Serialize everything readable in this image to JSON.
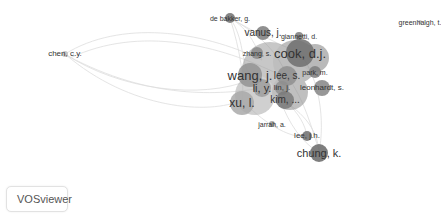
{
  "app": {
    "name": "VOSviewer"
  },
  "network": {
    "type": "co-authorship",
    "colors": {
      "link": "#cfcfcf",
      "node_dark": "#6e6e6e",
      "node_mid": "#8f8f8f",
      "node_light": "#b5b5b5",
      "label": "#333333"
    },
    "nodes": [
      {
        "label": "de bakker, g.",
        "x": 230,
        "y": 18,
        "r": 5,
        "size": 7,
        "shade": "#707070"
      },
      {
        "label": "vanus, j.",
        "x": 263,
        "y": 33,
        "r": 7,
        "size": 10,
        "shade": "#7c7c7c"
      },
      {
        "label": "giannetti, d.",
        "x": 299,
        "y": 36,
        "r": 4,
        "size": 7,
        "shade": "#7a7a7a"
      },
      {
        "label": "greenhalgh, t.",
        "x": 420,
        "y": 22,
        "r": 2,
        "size": 7,
        "shade": "#bbbbbb"
      },
      {
        "label": "chen, c.y.",
        "x": 65,
        "y": 54,
        "r": 3,
        "size": 8,
        "shade": "#bdbdbd"
      },
      {
        "label": "zhang, s.",
        "x": 257,
        "y": 53,
        "r": 6,
        "size": 7,
        "shade": "#8a8a8a"
      },
      {
        "label": "cook, d.j.",
        "x": 300,
        "y": 53,
        "r": 14,
        "size": 13,
        "shade": "#6f6f6f"
      },
      {
        "label": "wang, j.",
        "x": 250,
        "y": 75,
        "r": 12,
        "size": 13,
        "shade": "#939393"
      },
      {
        "label": "lee, s.",
        "x": 287,
        "y": 76,
        "r": 10,
        "size": 10,
        "shade": "#8f8f8f"
      },
      {
        "label": "park, m.",
        "x": 315,
        "y": 72,
        "r": 6,
        "size": 7,
        "shade": "#7d7d7d"
      },
      {
        "label": "li, y.",
        "x": 262,
        "y": 88,
        "r": 9,
        "size": 11,
        "shade": "#9e9e9e"
      },
      {
        "label": "lin, j.",
        "x": 282,
        "y": 88,
        "r": 7,
        "size": 8,
        "shade": "#8e8e8e"
      },
      {
        "label": "leonhardt, s.",
        "x": 322,
        "y": 88,
        "r": 8,
        "size": 8,
        "shade": "#858585"
      },
      {
        "label": "kim, ...",
        "x": 285,
        "y": 100,
        "r": 9,
        "size": 10,
        "shade": "#7a7a7a"
      },
      {
        "label": "xu, l.",
        "x": 242,
        "y": 103,
        "r": 12,
        "size": 12,
        "shade": "#a9a9a9"
      },
      {
        "label": "jarrah, a.",
        "x": 272,
        "y": 124,
        "r": 3,
        "size": 7,
        "shade": "#9a9a9a"
      },
      {
        "label": "lee, j.h.",
        "x": 307,
        "y": 136,
        "r": 5,
        "size": 8,
        "shade": "#6e6e6e"
      },
      {
        "label": "chung, k.",
        "x": 319,
        "y": 153,
        "r": 9,
        "size": 11,
        "shade": "#676767"
      }
    ]
  }
}
